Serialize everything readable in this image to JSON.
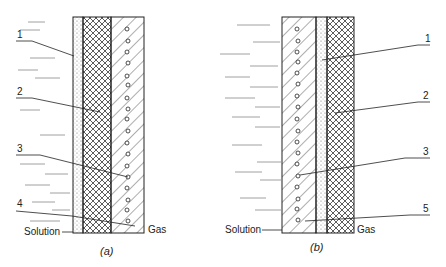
{
  "figure_a": {
    "caption": "(a)",
    "left_label": "Solution",
    "right_label": "Gas",
    "callouts": [
      "1",
      "2",
      "3",
      "4"
    ],
    "layers": [
      "porous-dotted",
      "crosshatch",
      "diagonal-with-pores"
    ]
  },
  "figure_b": {
    "caption": "(b)",
    "left_label": "Solution",
    "right_label": "Gas",
    "callouts": [
      "1",
      "2",
      "3",
      "5"
    ],
    "layers": [
      "diagonal-with-pores",
      "porous-dotted",
      "crosshatch"
    ]
  },
  "colors": {
    "ink": "#222222",
    "background": "#ffffff"
  }
}
